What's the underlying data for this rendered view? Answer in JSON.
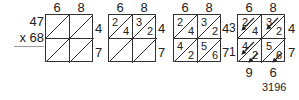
{
  "problem": {
    "multiplicand": "47",
    "multiplier": "x 68"
  },
  "top_digits": [
    "6",
    "8"
  ],
  "side_digits": [
    "4",
    "7"
  ],
  "grids": [
    {
      "step": 1,
      "cells": [
        [
          "",
          ""
        ],
        [
          "",
          ""
        ]
      ]
    },
    {
      "step": 2,
      "cells": [
        [
          {
            "tens": "2",
            "ones": "4"
          },
          {
            "tens": "3",
            "ones": "2"
          }
        ],
        [
          {
            "tens": "",
            "ones": ""
          },
          {
            "tens": "",
            "ones": ""
          }
        ]
      ]
    },
    {
      "step": 3,
      "cells": [
        [
          {
            "tens": "2",
            "ones": "4"
          },
          {
            "tens": "3",
            "ones": "2"
          }
        ],
        [
          {
            "tens": "4",
            "ones": "2"
          },
          {
            "tens": "5",
            "ones": "6"
          }
        ]
      ]
    },
    {
      "step": 4,
      "cells": [
        [
          {
            "tens": "2",
            "ones": "4"
          },
          {
            "tens": "3",
            "ones": "2"
          }
        ],
        [
          {
            "tens": "4",
            "ones": "2"
          },
          {
            "tens": "5",
            "ones": "6"
          }
        ]
      ],
      "left_sums": [
        "3",
        "1"
      ],
      "bottom_sums": [
        "9",
        "6"
      ]
    }
  ],
  "final_answer": "3196"
}
